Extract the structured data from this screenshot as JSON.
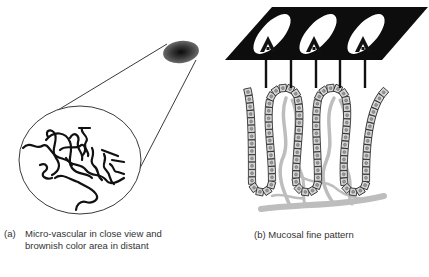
{
  "panels": [
    {
      "id": "a",
      "label": "(a)",
      "caption_line1": "Micro-vascular in close view and",
      "caption_line2": "brownish color area in distant",
      "elements": {
        "distant_spot": "brownish color area (dark shaded ellipse)",
        "magnified_circle": "micro-vascular pattern in close view (tortuous vessels)"
      }
    },
    {
      "id": "b",
      "label": "(b)",
      "caption": "(b) Mucosal fine pattern",
      "elements": {
        "surface_plane": "black parallelogram with three white oval pits",
        "pits": 3,
        "crypts": 3,
        "epithelium": "chain of square cells forming U-shaped crypts",
        "vessels": "gray capillary network beneath crypts"
      }
    }
  ],
  "colors": {
    "background": "#ffffff",
    "ink": "#111111",
    "vessel_gray": "#bdbdbd",
    "cell_fill": "#d9d9d9",
    "spot_dark": "#1a1a1a"
  }
}
